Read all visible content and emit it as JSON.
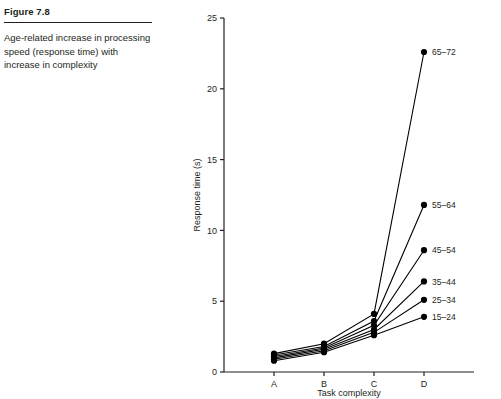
{
  "figure": {
    "number_label": "Figure 7.8",
    "caption": "Age-related increase in processing speed (response time) with increase in complexity"
  },
  "chart_data": {
    "type": "line",
    "title": "",
    "xlabel": "Task complexity",
    "ylabel": "Response time (s)",
    "categories": [
      "A",
      "B",
      "C",
      "D"
    ],
    "xlim": [
      0,
      5
    ],
    "ylim": [
      0,
      25
    ],
    "yticks": [
      0,
      5,
      10,
      15,
      20,
      25
    ],
    "ytick_labels": [
      "0",
      "5",
      "10",
      "15",
      "20",
      "25"
    ],
    "grid": false,
    "legend": "inline-right-labels",
    "series": [
      {
        "name": "65–72",
        "values": [
          1.3,
          2.0,
          4.1,
          22.6
        ]
      },
      {
        "name": "55–64",
        "values": [
          1.2,
          1.8,
          3.6,
          11.8
        ]
      },
      {
        "name": "45–54",
        "values": [
          1.1,
          1.7,
          3.3,
          8.6
        ]
      },
      {
        "name": "35–44",
        "values": [
          1.0,
          1.6,
          3.0,
          6.4
        ]
      },
      {
        "name": "25–34",
        "values": [
          0.9,
          1.5,
          2.8,
          5.1
        ]
      },
      {
        "name": "15–24",
        "values": [
          0.8,
          1.4,
          2.6,
          3.9
        ]
      }
    ],
    "colors": {
      "line": "#000000",
      "marker": "#000000",
      "axis": "#231f20",
      "text": "#231f20"
    }
  }
}
